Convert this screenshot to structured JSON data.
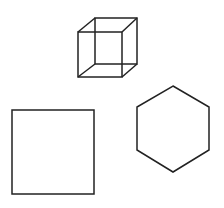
{
  "canvas": {
    "width": 224,
    "height": 208,
    "background": "#ffffff"
  },
  "stroke_color": "#222222",
  "shapes": {
    "cube": {
      "label": "wireframe cube",
      "front": {
        "x": 78,
        "y": 32,
        "w": 44,
        "h": 45
      },
      "back": {
        "x": 95,
        "y": 18,
        "w": 42,
        "h": 46
      }
    },
    "square": {
      "label": "square",
      "x": 12,
      "y": 110,
      "w": 82,
      "h": 84
    },
    "hexagon": {
      "label": "hexagon",
      "points": "173,86 209,107 209,150 173,172 137,150 137,107"
    }
  }
}
